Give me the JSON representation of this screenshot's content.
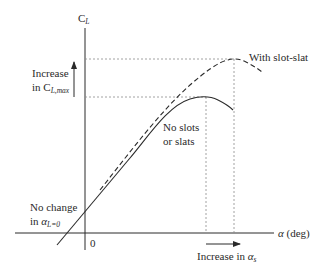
{
  "axes": {
    "y_label_main": "C",
    "y_label_sub": "L",
    "x_label_symbol": "α",
    "x_label_unit": " (deg)",
    "origin_label": "0"
  },
  "annotations": {
    "increase_clmax_line1": "Increase",
    "increase_clmax_line2_prefix": "in C",
    "increase_clmax_line2_sub": "L,max",
    "with_slot_slat": "With slot-slat",
    "no_slots_line1": "No slots",
    "no_slots_line2": "or slats",
    "no_change_line1": "No change",
    "no_change_line2_prefix": "in ",
    "no_change_line2_symbol": "α",
    "no_change_line2_sub": "L=0",
    "increase_alpha_prefix": "Increase in ",
    "increase_alpha_symbol": "α",
    "increase_alpha_sub": "s"
  },
  "colors": {
    "ink": "#2a2a2a",
    "guide": "#8a8a8a",
    "background": "#ffffff"
  },
  "curves": [
    {
      "name": "No slots or slats",
      "style": "solid",
      "peak_px": [
        206,
        97
      ]
    },
    {
      "name": "With slot-slat",
      "style": "dashed",
      "peak_px": [
        234,
        59
      ]
    }
  ]
}
